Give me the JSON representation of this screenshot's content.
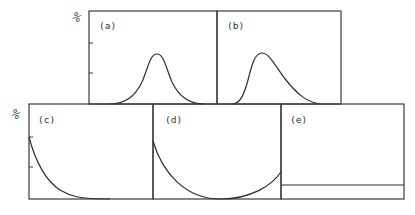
{
  "figure": {
    "y_axis_symbol": "%",
    "panels": [
      {
        "id": "a",
        "label": "(a)",
        "shape": "symmetric bell curve (normal distribution)"
      },
      {
        "id": "b",
        "label": "(b)",
        "shape": "right-skewed bell curve"
      },
      {
        "id": "c",
        "label": "(c)",
        "shape": "monotonically decreasing (J-shaped) curve"
      },
      {
        "id": "d",
        "label": "(d)",
        "shape": "U-shaped curve"
      },
      {
        "id": "e",
        "label": "(e)",
        "shape": "flat horizontal line (uniform distribution)"
      }
    ]
  },
  "colors": {
    "line": "#2e2e2e",
    "background": "#ffffff"
  }
}
